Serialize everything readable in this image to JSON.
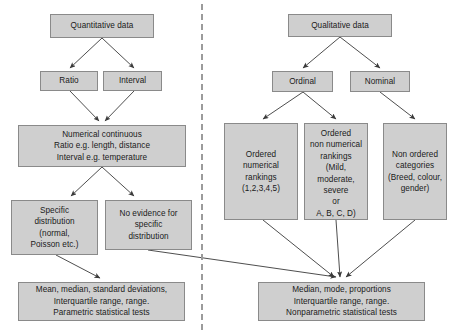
{
  "diagram": {
    "divider": {
      "name": "vertical-dashed-divider",
      "x": 201
    },
    "style": {
      "box_fill": "#cfcfcf",
      "box_border": "#8a8a8a",
      "arrow_color": "#3a3a3a",
      "divider_color": "#9b9b9b",
      "background": "#ffffff",
      "text_color": "#1a1a1a"
    },
    "nodes": [
      {
        "id": "quantitative_data",
        "label": "Quantitative data",
        "x": 50,
        "y": 14,
        "w": 104,
        "h": 24,
        "align": "center"
      },
      {
        "id": "ratio",
        "label": "Ratio",
        "x": 40,
        "y": 71,
        "w": 58,
        "h": 20,
        "align": "center"
      },
      {
        "id": "interval",
        "label": "Interval",
        "x": 103,
        "y": 71,
        "w": 59,
        "h": 20,
        "align": "center"
      },
      {
        "id": "numerical_continuous",
        "label": "Numerical continuous\nRatio e.g. length, distance\nInterval e.g. temperature",
        "x": 18,
        "y": 125,
        "w": 168,
        "h": 42,
        "align": "center"
      },
      {
        "id": "specific_distribution",
        "label": "Specific\ndistribution\n(normal,\nPoisson etc.)",
        "x": 11,
        "y": 200,
        "w": 87,
        "h": 55,
        "align": "center"
      },
      {
        "id": "no_evidence_specific",
        "label": "No evidence for\nspecific\ndistribution",
        "x": 105,
        "y": 200,
        "w": 87,
        "h": 50,
        "align": "center"
      },
      {
        "id": "parametric_tests",
        "label": "Mean, median, standard deviations,\nInterquartile range, range.\nParametric statistical tests",
        "x": 18,
        "y": 282,
        "w": 167,
        "h": 39,
        "align": "center"
      },
      {
        "id": "qualitative_data",
        "label": "Qualitative data",
        "x": 288,
        "y": 14,
        "w": 104,
        "h": 23,
        "align": "center"
      },
      {
        "id": "ordinal",
        "label": "Ordinal",
        "x": 272,
        "y": 71,
        "w": 61,
        "h": 21,
        "align": "center"
      },
      {
        "id": "nominal",
        "label": "Nominal",
        "x": 350,
        "y": 71,
        "w": 60,
        "h": 21,
        "align": "center"
      },
      {
        "id": "ordered_numerical",
        "label": "Ordered\nnumerical\nrankings\n(1,2,3,4,5)",
        "x": 224,
        "y": 123,
        "w": 74,
        "h": 97,
        "align": "center"
      },
      {
        "id": "ordered_non_numerical",
        "label": "Ordered\nnon numerical\nrankings\n(Mild, moderate,\nsevere\nor\nA, B, C, D)",
        "x": 304,
        "y": 123,
        "w": 64,
        "h": 97,
        "align": "top"
      },
      {
        "id": "non_ordered_categories",
        "label": "Non ordered\ncategories\n(Breed, colour,\ngender)",
        "x": 383,
        "y": 123,
        "w": 64,
        "h": 97,
        "align": "center"
      },
      {
        "id": "nonparametric_tests",
        "label": "Median, mode, proportions\nInterquartile range, range.\nNonparametric statistical tests",
        "x": 258,
        "y": 282,
        "w": 167,
        "h": 39,
        "align": "center"
      }
    ],
    "edges": [
      {
        "from": "quantitative_data",
        "to": "ratio",
        "path": "M 102,38 L 70,68"
      },
      {
        "from": "quantitative_data",
        "to": "interval",
        "path": "M 102,38 L 134,68"
      },
      {
        "from": "ratio",
        "to": "numerical_continuous",
        "path": "M 70,91 L 99,121"
      },
      {
        "from": "interval",
        "to": "numerical_continuous",
        "path": "M 134,91 L 105,121"
      },
      {
        "from": "numerical_continuous",
        "to": "specific_distribution",
        "path": "M 102,167 L 71,196"
      },
      {
        "from": "numerical_continuous",
        "to": "no_evidence_specific",
        "path": "M 102,167 L 134,196"
      },
      {
        "from": "specific_distribution",
        "to": "parametric_tests",
        "path": "M 56,255 L 100,278"
      },
      {
        "from": "no_evidence_specific",
        "to": "nonparametric_tests",
        "path": "M 148,250 L 336,277"
      },
      {
        "from": "qualitative_data",
        "to": "ordinal",
        "path": "M 340,37 L 303,68"
      },
      {
        "from": "qualitative_data",
        "to": "nominal",
        "path": "M 340,37 L 380,68"
      },
      {
        "from": "ordinal",
        "to": "ordered_numerical",
        "path": "M 303,92 L 263,119"
      },
      {
        "from": "ordinal",
        "to": "ordered_non_numerical",
        "path": "M 303,92 L 336,119"
      },
      {
        "from": "nominal",
        "to": "non_ordered_categories",
        "path": "M 380,92 L 415,119"
      },
      {
        "from": "ordered_numerical",
        "to": "nonparametric_tests",
        "path": "M 263,220 L 334,277"
      },
      {
        "from": "ordered_non_numerical",
        "to": "nonparametric_tests",
        "path": "M 336,220 L 340,277"
      },
      {
        "from": "non_ordered_categories",
        "to": "nonparametric_tests",
        "path": "M 415,220 L 346,277"
      }
    ]
  }
}
